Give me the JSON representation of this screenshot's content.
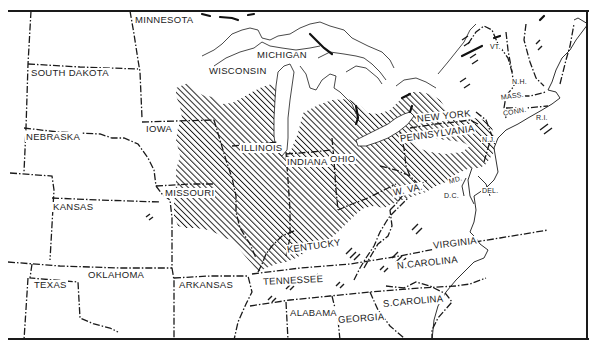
{
  "map": {
    "frame": {
      "left": 8,
      "top": 11,
      "right": 588,
      "bottom": 340
    },
    "colors": {
      "ink": "#1a1a1a",
      "paper": "#ffffff",
      "hatch": "#1a1a1a"
    },
    "shaded_region": "diagonal hatching across Midwest and Ohio Valley states",
    "states": {
      "minnesota": "MINNESOTA",
      "south_dakota": "SOUTH DAKOTA",
      "nebraska": "NEBRASKA",
      "kansas": "KANSAS",
      "oklahoma": "OKLAHOMA",
      "texas": "TEXAS",
      "iowa": "IOWA",
      "missouri": "MISSOURI",
      "arkansas": "ARKANSAS",
      "wisconsin": "WISCONSIN",
      "michigan": "MICHIGAN",
      "illinois": "ILLINOIS",
      "indiana": "INDIANA",
      "ohio": "OHIO",
      "kentucky": "KENTUCKY",
      "tennessee": "TENNESSEE",
      "alabama": "ALABAMA",
      "georgia": "GEORGIA",
      "south_carolina": "S.CAROLINA",
      "north_carolina": "N.CAROLINA",
      "virginia": "VIRGINIA",
      "west_virginia": "W. VA.",
      "maryland": "MD.",
      "dc": "D.C.",
      "delaware": "DEL.",
      "new_jersey": "N.J.",
      "pennsylvania": "PENNSYLVANIA",
      "new_york": "NEW YORK",
      "vermont": "VT.",
      "new_hampshire": "N.H.",
      "massachusetts": "MASS.",
      "connecticut": "CONN.",
      "rhode_island": "R.I."
    }
  }
}
